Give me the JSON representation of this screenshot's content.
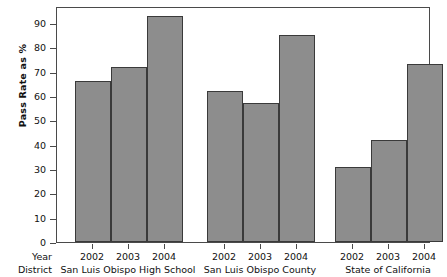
{
  "chart_data": {
    "type": "bar",
    "title": "",
    "xlabel": "",
    "ylabel": "Pass Rate as %",
    "ylim": [
      0,
      97
    ],
    "grid": false,
    "legend": "none",
    "categories": [
      "2002",
      "2003",
      "2004"
    ],
    "group_axis_label": "District",
    "category_axis_label": "Year",
    "groups": [
      {
        "name": "San Luis Obispo High School",
        "points": [
          {
            "x": "2002",
            "y": 66
          },
          {
            "x": "2003",
            "y": 72
          },
          {
            "x": "2004",
            "y": 93
          }
        ]
      },
      {
        "name": "San Luis Obispo County",
        "points": [
          {
            "x": "2002",
            "y": 62
          },
          {
            "x": "2003",
            "y": 57
          },
          {
            "x": "2004",
            "y": 85
          }
        ]
      },
      {
        "name": "State of California",
        "points": [
          {
            "x": "2002",
            "y": 31
          },
          {
            "x": "2003",
            "y": 42
          },
          {
            "x": "2004",
            "y": 73
          }
        ]
      }
    ],
    "y_ticks": [
      0,
      10,
      20,
      30,
      40,
      50,
      60,
      70,
      80,
      90
    ],
    "y_tick_labels": [
      "0",
      "10",
      "20",
      "30",
      "40",
      "50",
      "60",
      "70",
      "80",
      "90"
    ],
    "colors": {
      "bar_fill": "#8d8d8d",
      "bar_stroke": "#3a3a3a",
      "axis": "#4a4a4a",
      "text": "#111111",
      "background": "#ffffff"
    }
  }
}
